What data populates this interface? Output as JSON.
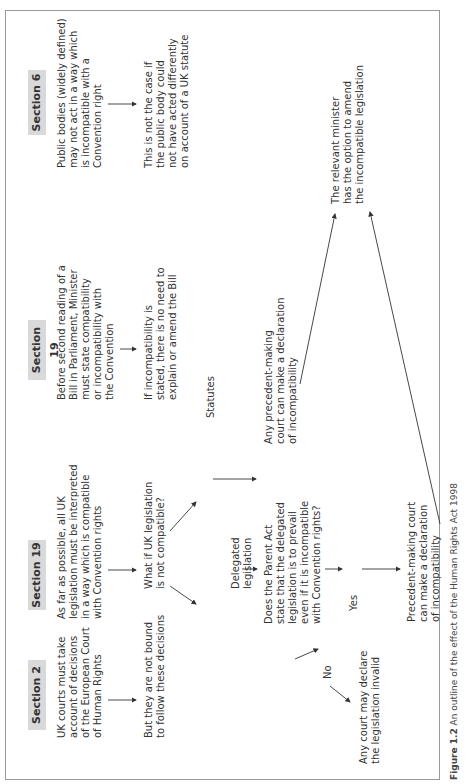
{
  "caption": {
    "figure_label": "Figure 1.2",
    "text": "An outline of the effect of the Human Rights Act 1998"
  },
  "sections": [
    {
      "label": "Section 2",
      "main": "UK courts must take\naccount of decisions\nof the European Court\nof Human Rights",
      "follow": "But they are not bound\nto follow these decisions"
    },
    {
      "label": "Section 3",
      "main": "As far as possible, all UK\nlegislation must be interpreted\nin a way which is compatible\nwith Convention rights",
      "question": "What if UK legislation\nis not compatible?",
      "delegated": "Delegated\nlegislation",
      "statutes": "Statutes",
      "parent_act_q": "Does the Parent Act\nstate that the delegated\nlegislation is to prevail\neven if it is incompatible\nwith Convention rights?",
      "yes": "Yes",
      "no": "No",
      "no_outcome": "Any court may declare\nthe legislation invalid",
      "yes_outcome": "Precedent-making court\ncan make a declaration\nof incompatibility",
      "statutes_outcome": "Any precedent-making\ncourt can make a declaration\nof incompatibility",
      "minister": "The relevant minister\nhas the option to amend\nthe incompatible legislation"
    },
    {
      "label": "Section 19",
      "main": "Before second reading of a\nBill in Parliament, Minister\nmust state compatibility\nor incompatibility with\nthe Convention",
      "follow": "If incompatibility is\nstated, there is no need to\nexplain or amend the Bill"
    },
    {
      "label": "Section 6",
      "main": "Public bodies (widely defined)\nmay not act in a way which\nis incompatible with a\nConvention right",
      "follow": "This is not the case if\nthe public body could\nnot have acted differently\non account of a UK statute"
    }
  ],
  "colors": {
    "label_bg": "#d9d9d9",
    "frame": "#9a9a9a",
    "text": "#333333"
  }
}
